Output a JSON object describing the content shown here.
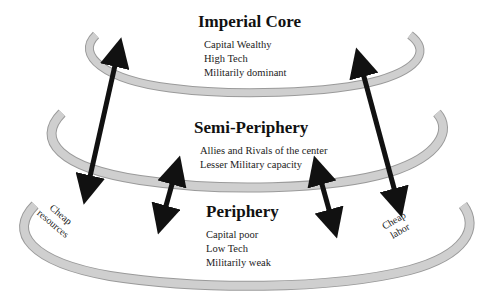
{
  "diagram": {
    "levels": [
      {
        "id": "imperial-core",
        "title": "Imperial Core",
        "traits": [
          "Capital Wealthy",
          "High Tech",
          "Militarily dominant"
        ]
      },
      {
        "id": "semi-periphery",
        "title": "Semi-Periphery",
        "traits": [
          "Allies and Rivals of the center",
          "Lesser Military capacity"
        ]
      },
      {
        "id": "periphery",
        "title": "Periphery",
        "traits": [
          "Capital poor",
          "Low Tech",
          "Militarily weak"
        ]
      }
    ],
    "flows": {
      "left_label": [
        "Cheap",
        "resources"
      ],
      "right_label": [
        "Cheap",
        "labor"
      ]
    },
    "colors": {
      "band_fill": "#c8c8c8",
      "band_stroke": "#9a9a9a",
      "arrow": "#111111"
    }
  }
}
